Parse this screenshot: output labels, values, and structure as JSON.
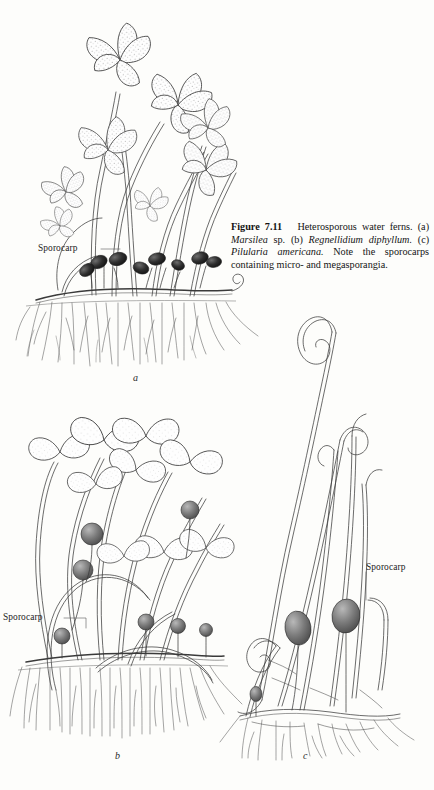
{
  "page": {
    "background_color": "#fdfdfb",
    "ink_color": "#3b3b3b",
    "folio": "0"
  },
  "figure": {
    "number_label": "Figure 7.11",
    "caption_parts": {
      "lead": "Heterosporous water ferns.",
      "a_prefix": "(a)",
      "a_genus": "Marsilea",
      "a_suffix": "sp.",
      "b_prefix": "(b)",
      "b_species": "Regnellidium diphyllum.",
      "c_prefix": "(c)",
      "c_species": "Pilularia americana.",
      "tail": "Note the sporocarps containing micro- and megasporangia."
    },
    "caption_plain": "Figure 7.11   Heterosporous water ferns. (a) Marsilea sp. (b) Regnellidium diphyllum. (c) Pilularia americana. Note the sporocarps containing micro- and megasporangia."
  },
  "panels": [
    {
      "letter": "a",
      "name": "marsilea-panel",
      "species": "Marsilea sp."
    },
    {
      "letter": "b",
      "name": "regnellidium-panel",
      "species": "Regnellidium diphyllum"
    },
    {
      "letter": "c",
      "name": "pilularia-panel",
      "species": "Pilularia americana"
    }
  ],
  "annotations": [
    {
      "id": "sporocarp-a",
      "label": "Sporocarp",
      "panel": "a"
    },
    {
      "id": "sporocarp-b",
      "label": "Sporocarp",
      "panel": "b"
    },
    {
      "id": "sporocarp-c",
      "label": "Sporocarp",
      "panel": "c"
    }
  ]
}
